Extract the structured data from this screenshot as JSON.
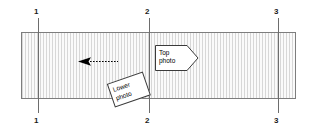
{
  "diagram": {
    "canvas": {
      "width": 316,
      "height": 132,
      "background": "#ffffff"
    },
    "band": {
      "name": "hatched-stratum-band",
      "fill": "#f2f2f2",
      "hatch_color": "#d7d7d7",
      "border_color": "#7d7d7d",
      "left": 21,
      "top": 32,
      "width": 275,
      "height": 67
    },
    "section_lines": [
      {
        "id": "1",
        "x": 38,
        "top_label": "1",
        "bottom_label": "1"
      },
      {
        "id": "2",
        "x": 149,
        "top_label": "2",
        "bottom_label": "2"
      },
      {
        "id": "3",
        "x": 278,
        "top_label": "3",
        "bottom_label": "3"
      }
    ],
    "arrow": {
      "name": "view-direction-arrow",
      "direction": "left",
      "style": "dashed-tail-solid-head",
      "color": "#000000",
      "x_start": 118,
      "x_end": 78,
      "y": 61
    },
    "callouts": [
      {
        "id": "top-photo",
        "shape": "pennant-right",
        "line1": "Top",
        "line2": "photo",
        "x": 155,
        "y": 45,
        "rotation": 0,
        "fill": "#ffffff",
        "stroke": "#3a3a3a"
      },
      {
        "id": "lower-photo",
        "shape": "rotated-rectangle",
        "line1": "Lower",
        "line2": "photo",
        "x": 110,
        "y": 77,
        "rotation": -19,
        "fill": "#ffffff",
        "stroke": "#3a3a3a"
      }
    ]
  }
}
